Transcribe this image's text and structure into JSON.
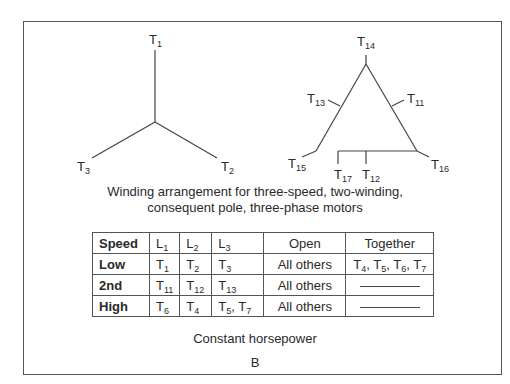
{
  "wye_diagram": {
    "terminals": [
      {
        "letter": "T",
        "sub": "1"
      },
      {
        "letter": "T",
        "sub": "3"
      },
      {
        "letter": "T",
        "sub": "2"
      }
    ]
  },
  "delta_diagram": {
    "terminals": [
      {
        "letter": "T",
        "sub": "14"
      },
      {
        "letter": "T",
        "sub": "13"
      },
      {
        "letter": "T",
        "sub": "11"
      },
      {
        "letter": "T",
        "sub": "15"
      },
      {
        "letter": "T",
        "sub": "17"
      },
      {
        "letter": "T",
        "sub": "12"
      },
      {
        "letter": "T",
        "sub": "16"
      }
    ]
  },
  "caption": {
    "line1": "Winding arrangement for three-speed, two-winding,",
    "line2": "consequent pole, three-phase motors"
  },
  "table": {
    "headers": [
      {
        "text": "Speed"
      },
      {
        "letter": "L",
        "sub": "1"
      },
      {
        "letter": "L",
        "sub": "2"
      },
      {
        "letter": "L",
        "sub": "3"
      },
      {
        "text": "Open"
      },
      {
        "text": "Together"
      }
    ],
    "rows": [
      {
        "speed": "Low",
        "l1": {
          "letter": "T",
          "sub": "1"
        },
        "l2": {
          "letter": "T",
          "sub": "2"
        },
        "l3": [
          {
            "letter": "T",
            "sub": "3"
          }
        ],
        "open": "All others",
        "together": [
          {
            "letter": "T",
            "sub": "4",
            "sep": ", "
          },
          {
            "letter": "T",
            "sub": "5",
            "sep": ", "
          },
          {
            "letter": "T",
            "sub": "6",
            "sep": ", "
          },
          {
            "letter": "T",
            "sub": "7",
            "sep": ""
          }
        ]
      },
      {
        "speed": "2nd",
        "l1": {
          "letter": "T",
          "sub": "11"
        },
        "l2": {
          "letter": "T",
          "sub": "12"
        },
        "l3": [
          {
            "letter": "T",
            "sub": "13"
          }
        ],
        "open": "All others",
        "together": "dash"
      },
      {
        "speed": "High",
        "l1": {
          "letter": "T",
          "sub": "6"
        },
        "l2": {
          "letter": "T",
          "sub": "4"
        },
        "l3": [
          {
            "letter": "T",
            "sub": "5",
            "sep": ", "
          },
          {
            "letter": "T",
            "sub": "7",
            "sep": ""
          }
        ],
        "open": "All others",
        "together": "dash"
      }
    ]
  },
  "footer": {
    "subtitle": "Constant horsepower",
    "figure_label": "B"
  }
}
